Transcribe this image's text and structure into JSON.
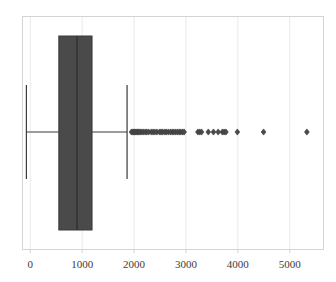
{
  "chart_data": {
    "type": "box",
    "title": "",
    "xlabel": "",
    "ylabel": "",
    "orientation": "horizontal",
    "grid": true,
    "grid_axis": "x",
    "legend": false,
    "xlim": [
      -150,
      5650
    ],
    "xticks": [
      0,
      1000,
      2000,
      3000,
      4000,
      5000
    ],
    "xticklabels": [
      "0",
      "1000",
      "2000",
      "3000",
      "4000",
      "5000"
    ],
    "box_color": "#4a4a4a",
    "line_color": "#3a3a3a",
    "grid_color": "#eaeaea",
    "frame_color": "#d4d4d4",
    "marker": "diamond",
    "boxes": [
      {
        "name": "series-1",
        "q1": 550,
        "median": 900,
        "q3": 1190,
        "whisker_low": -75,
        "whisker_high": 1865,
        "outliers": [
          1950,
          1975,
          1995,
          2010,
          2030,
          2055,
          2075,
          2095,
          2120,
          2150,
          2180,
          2215,
          2245,
          2280,
          2330,
          2365,
          2400,
          2440,
          2490,
          2520,
          2550,
          2590,
          2620,
          2660,
          2700,
          2735,
          2765,
          2800,
          2835,
          2870,
          2900,
          2935,
          2965,
          3230,
          3265,
          3300,
          3430,
          3530,
          3620,
          3700,
          3735,
          3770,
          3990,
          4495,
          5330
        ]
      }
    ]
  },
  "axis": {
    "tick_labels": [
      "0",
      "1000",
      "2000",
      "3000",
      "4000",
      "5000"
    ]
  }
}
